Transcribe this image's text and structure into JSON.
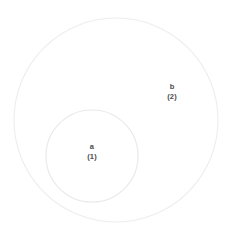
{
  "diagram": {
    "background_color": "#ffffff",
    "stroke_color": "#ededed",
    "inner_stroke_color": "#e8e8e8",
    "fill_color": "#ffffff",
    "text_color": "#4a4a4a",
    "sets": [
      {
        "id": "b",
        "name": "b",
        "count": "(2)",
        "cx": 116,
        "cy": 120,
        "r": 102
      },
      {
        "id": "a",
        "name": "a",
        "count": "(1)",
        "cx": 92,
        "cy": 156,
        "r": 46
      }
    ]
  },
  "chart_data": {
    "type": "diagram",
    "subtype": "venn",
    "title": "",
    "sets": [
      "a",
      "b"
    ],
    "set_labels": [
      "a",
      "b"
    ],
    "set_counts": [
      1,
      2
    ],
    "set_count_labels": [
      "(1)",
      "(2)"
    ],
    "relation": "a is a proper subset of b",
    "regions": [
      {
        "label": "a",
        "count": 1,
        "count_label": "(1)"
      },
      {
        "label": "b",
        "count": 2,
        "count_label": "(2)"
      }
    ],
    "legend": "none",
    "grid": false
  }
}
